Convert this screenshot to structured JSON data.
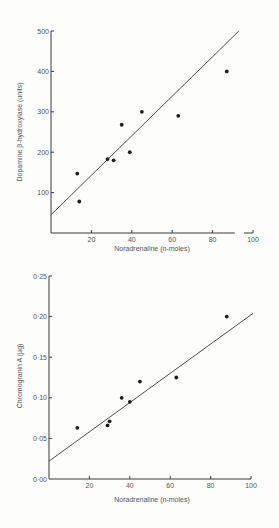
{
  "chart_data": [
    {
      "type": "scatter",
      "title": "",
      "xlabel": "Noradrenaline (n-moles)",
      "ylabel": "Dopamine β-hydroxylase (units)",
      "xlim": [
        0,
        100
      ],
      "ylim": [
        0,
        500
      ],
      "x_ticks": [
        20,
        40,
        60,
        80,
        100
      ],
      "x_tick_labels": [
        "20",
        "40",
        "60",
        "80",
        "100"
      ],
      "y_ticks": [
        100,
        200,
        300,
        400,
        500
      ],
      "y_tick_labels": [
        "100",
        "200",
        "300",
        "400",
        "500"
      ],
      "grid": false,
      "legend": null,
      "x_axis_break": true,
      "series": [
        {
          "name": "data",
          "points": [
            {
              "x": 13,
              "y": 147
            },
            {
              "x": 14,
              "y": 78
            },
            {
              "x": 28,
              "y": 183
            },
            {
              "x": 31,
              "y": 180
            },
            {
              "x": 35,
              "y": 268
            },
            {
              "x": 39,
              "y": 200
            },
            {
              "x": 45,
              "y": 300
            },
            {
              "x": 63,
              "y": 290
            },
            {
              "x": 87,
              "y": 400
            }
          ]
        }
      ],
      "regression_line": {
        "x0": 0,
        "y0": 45,
        "x1": 93,
        "y1": 500
      }
    },
    {
      "type": "scatter",
      "title": "",
      "xlabel": "Noradrenaline (n-moles)",
      "ylabel": "Chromogranin A (μg)",
      "xlim": [
        0,
        100
      ],
      "ylim": [
        0,
        0.25
      ],
      "x_ticks": [
        20,
        40,
        60,
        80,
        100
      ],
      "x_tick_labels": [
        "20",
        "40",
        "60",
        "80",
        "100"
      ],
      "y_ticks": [
        0,
        0.05,
        0.1,
        0.15,
        0.2,
        0.25
      ],
      "y_tick_labels": [
        "0·00",
        "0·05",
        "0·10",
        "0·15",
        "0·20",
        "0·25"
      ],
      "grid": false,
      "legend": null,
      "series": [
        {
          "name": "data",
          "points": [
            {
              "x": 14,
              "y": 0.063
            },
            {
              "x": 29,
              "y": 0.066
            },
            {
              "x": 30,
              "y": 0.071
            },
            {
              "x": 36,
              "y": 0.1
            },
            {
              "x": 40,
              "y": 0.095
            },
            {
              "x": 45,
              "y": 0.12
            },
            {
              "x": 63,
              "y": 0.125
            },
            {
              "x": 88,
              "y": 0.2
            }
          ]
        }
      ],
      "regression_line": {
        "x0": 0,
        "y0": 0.022,
        "x1": 101,
        "y1": 0.204
      }
    }
  ],
  "layout": [
    {
      "plot": {
        "x0": 51,
        "x100": 253,
        "ybase": 233,
        "ytop": 31
      }
    },
    {
      "plot": {
        "x0": 49,
        "x100": 251,
        "ybase": 479,
        "ytop": 276
      }
    }
  ]
}
